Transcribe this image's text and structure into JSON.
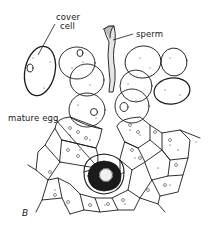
{
  "diagram": {
    "panel_label": "B",
    "labels": {
      "cover_cell_line1": "cover",
      "cover_cell_line2": "cell",
      "sperm": "sperm",
      "mature_egg": "mature egg"
    },
    "colors": {
      "ink": "#1a1a1a",
      "background": "#ffffff"
    }
  }
}
